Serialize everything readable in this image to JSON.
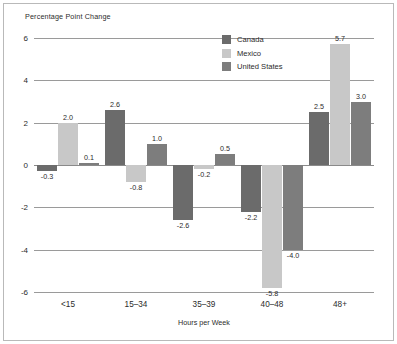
{
  "chart_data": {
    "type": "bar",
    "title": "",
    "ylabel": "Percentage Point Change",
    "xlabel": "Hours per Week",
    "categories": [
      "<15",
      "15–34",
      "35–39",
      "40–48",
      "48+"
    ],
    "series": [
      {
        "name": "Canada",
        "color": "#6b6b6b",
        "values": [
          -0.3,
          2.6,
          -2.6,
          -2.2,
          2.5
        ]
      },
      {
        "name": "Mexico",
        "color": "#c8c8c8",
        "values": [
          2.0,
          -0.8,
          -0.2,
          -5.8,
          5.7
        ]
      },
      {
        "name": "United States",
        "color": "#7d7d7d",
        "values": [
          0.1,
          1.0,
          0.5,
          -4.0,
          3.0
        ]
      }
    ],
    "data_labels": [
      [
        "-0.3",
        "2.6",
        "-2.6",
        "-2.2",
        "2.5"
      ],
      [
        "2.0",
        "-0.8",
        "-0.2",
        "-5.8",
        "5.7"
      ],
      [
        "0.1",
        "1.0",
        "0.5",
        "-4.0",
        "3.0"
      ]
    ],
    "ylim": [
      -6,
      6
    ],
    "yticks": [
      6,
      4,
      2,
      0,
      -2,
      -4,
      -6
    ],
    "ytick_labels": [
      "6",
      "4",
      "2",
      "0",
      "-2",
      "-4",
      "-6"
    ],
    "grid": true,
    "legend_position": "upper-center"
  }
}
